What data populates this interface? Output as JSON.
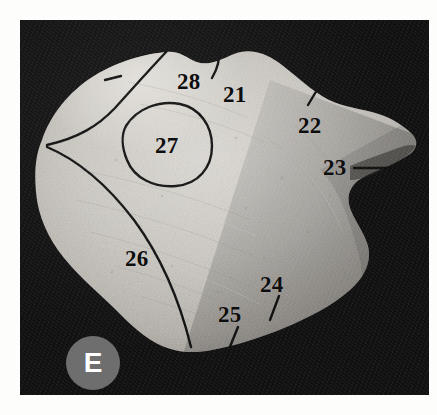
{
  "figure": {
    "panel_letter": "E",
    "background_color": "#111010",
    "page_color": "#fdfdfc",
    "badge_color": "#6e6e6e",
    "badge_letter_color": "#ffffff",
    "label_color": "#0d0d0d",
    "bone_color": "#c9c6c0",
    "specimen_description": "photograph of a bone specimen on black background"
  },
  "labels": [
    {
      "id": "21",
      "text": "21",
      "x": 218,
      "y": 78,
      "leader": "diagonal-up-right"
    },
    {
      "id": "22",
      "text": "22",
      "x": 294,
      "y": 108,
      "leader": "diagonal-up-right"
    },
    {
      "id": "23",
      "text": "23",
      "x": 324,
      "y": 163,
      "leader": "horizontal-right"
    },
    {
      "id": "24",
      "text": "24",
      "x": 257,
      "y": 281,
      "leader": "diagonal-down-left"
    },
    {
      "id": "25",
      "text": "25",
      "x": 218,
      "y": 307,
      "leader": "diagonal-down-left"
    },
    {
      "id": "26",
      "text": "26",
      "x": 126,
      "y": 250,
      "leader": "none"
    },
    {
      "id": "27",
      "text": "27",
      "x": 142,
      "y": 130,
      "leader": "enclosed-oval"
    },
    {
      "id": "28",
      "text": "28",
      "x": 176,
      "y": 77,
      "leader": "dash-left"
    }
  ]
}
